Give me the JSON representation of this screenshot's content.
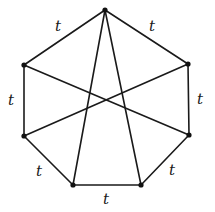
{
  "diagram": {
    "type": "graph",
    "vertices": [
      {
        "id": "v-top",
        "x": 105,
        "y": 10
      },
      {
        "id": "v-upper-right",
        "x": 188,
        "y": 64
      },
      {
        "id": "v-lower-right",
        "x": 189,
        "y": 135
      },
      {
        "id": "v-bottom-right",
        "x": 141,
        "y": 185
      },
      {
        "id": "v-bottom-left",
        "x": 73,
        "y": 185
      },
      {
        "id": "v-lower-left",
        "x": 24,
        "y": 136
      },
      {
        "id": "v-upper-left",
        "x": 24,
        "y": 65
      }
    ],
    "outer_edges": [
      {
        "from": "v-top",
        "to": "v-upper-right",
        "label": "t",
        "label_x": 152,
        "label_y": 27
      },
      {
        "from": "v-upper-right",
        "to": "v-lower-right",
        "label": "t",
        "label_x": 200,
        "label_y": 100
      },
      {
        "from": "v-lower-right",
        "to": "v-bottom-right",
        "label": "t",
        "label_x": 172,
        "label_y": 171
      },
      {
        "from": "v-bottom-right",
        "to": "v-bottom-left",
        "label": "t",
        "label_x": 106,
        "label_y": 200
      },
      {
        "from": "v-bottom-left",
        "to": "v-lower-left",
        "label": "t",
        "label_x": 39,
        "label_y": 172
      },
      {
        "from": "v-lower-left",
        "to": "v-upper-left",
        "label": "t",
        "label_x": 11,
        "label_y": 101
      },
      {
        "from": "v-upper-left",
        "to": "v-top",
        "label": "t",
        "label_x": 58,
        "label_y": 27
      }
    ],
    "diagonals": [
      {
        "from": "v-top",
        "to": "v-bottom-left"
      },
      {
        "from": "v-top",
        "to": "v-bottom-right"
      },
      {
        "from": "v-upper-left",
        "to": "v-lower-right"
      },
      {
        "from": "v-upper-right",
        "to": "v-lower-left"
      }
    ],
    "labels": {
      "edge_top_right": "t",
      "edge_right": "t",
      "edge_bottom_right": "t",
      "edge_bottom": "t",
      "edge_bottom_left": "t",
      "edge_left": "t",
      "edge_top_left": "t"
    },
    "colors": {
      "line": "#1a1a1a",
      "vertex": "#111111",
      "background": "#ffffff"
    }
  }
}
